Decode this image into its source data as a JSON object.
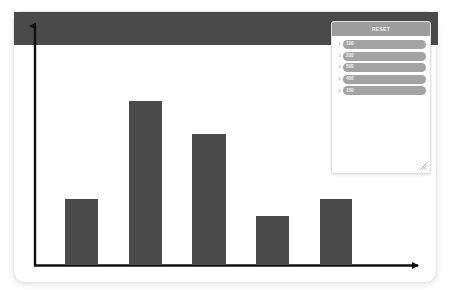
{
  "chart_data": {
    "type": "bar",
    "title": "",
    "xlabel": "",
    "ylabel": "",
    "categories": [
      "1",
      "2",
      "3",
      "4",
      "5"
    ],
    "values": [
      100,
      200,
      500,
      400,
      150
    ],
    "ylim": [
      0,
      560
    ],
    "grid": false,
    "legend_position": "top-right",
    "bar_color": "#4a4a4a",
    "axis_color": "#111111"
  },
  "card": {
    "background": "#ffffff",
    "border_color": "#e9e9e9"
  },
  "axes": {
    "y_axis_name": "y-axis-arrow",
    "x_axis_name": "x-axis-arrow"
  },
  "panel": {
    "header_title": "RESET",
    "header_color": "#9d9d9d",
    "pill_color": "#a3a3a3",
    "rows": [
      {
        "index": "1",
        "value": "100"
      },
      {
        "index": "2",
        "value": "200"
      },
      {
        "index": "3",
        "value": "500"
      },
      {
        "index": "4",
        "value": "400"
      },
      {
        "index": "5",
        "value": "150"
      }
    ],
    "resize_grip": "resize-grip-icon"
  }
}
